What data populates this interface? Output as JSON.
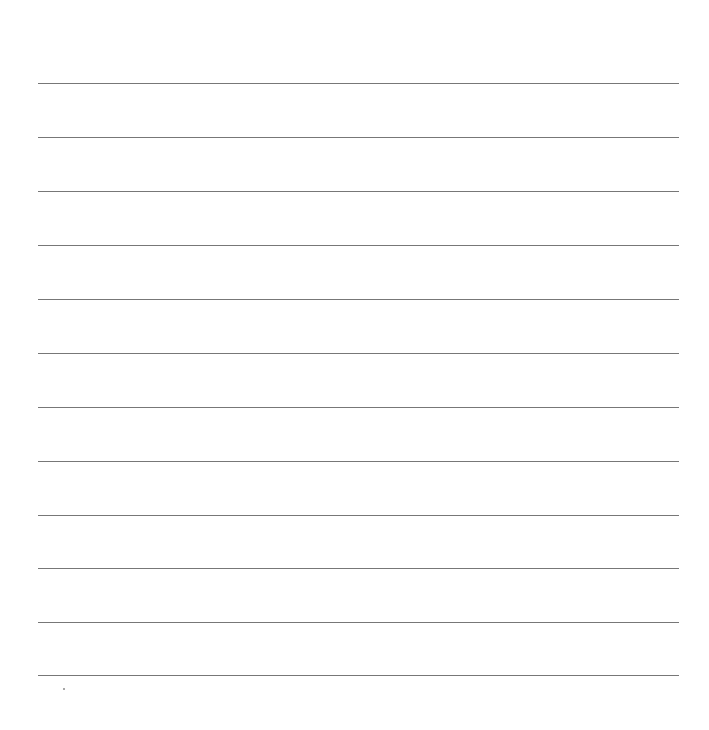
{
  "page": {
    "type": "lined-paper",
    "background_color": "#ffffff",
    "line_color": "#777777",
    "line_left": 38,
    "line_width": 641,
    "line_thickness": 1,
    "line_spacing": 54,
    "lines": [
      {
        "y": 83
      },
      {
        "y": 137
      },
      {
        "y": 191
      },
      {
        "y": 245
      },
      {
        "y": 299
      },
      {
        "y": 353
      },
      {
        "y": 407
      },
      {
        "y": 461
      },
      {
        "y": 515
      },
      {
        "y": 568
      },
      {
        "y": 622
      },
      {
        "y": 675
      }
    ],
    "marks": [
      {
        "x": 63,
        "y": 688
      }
    ]
  }
}
